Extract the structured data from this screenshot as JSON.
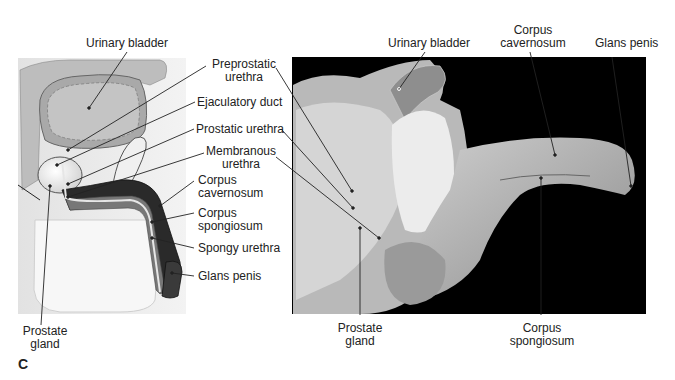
{
  "figure": {
    "panel_letter": "C",
    "illustration": {
      "labels": {
        "urinary_bladder": "Urinary bladder",
        "preprostatic_urethra_1": "Preprostatic",
        "preprostatic_urethra_2": "urethra",
        "ejaculatory_duct": "Ejaculatory duct",
        "prostatic_urethra": "Prostatic urethra",
        "membranous_urethra_1": "Membranous",
        "membranous_urethra_2": "urethra",
        "corpus_cavernosum_1": "Corpus",
        "corpus_cavernosum_2": "cavernosum",
        "corpus_spongiosum_1": "Corpus",
        "corpus_spongiosum_2": "spongiosum",
        "spongy_urethra": "Spongy urethra",
        "glans_penis": "Glans penis",
        "prostate_gland_1": "Prostate",
        "prostate_gland_2": "gland"
      }
    },
    "photo": {
      "labels": {
        "urinary_bladder": "Urinary bladder",
        "corpus_cavernosum_1": "Corpus",
        "corpus_cavernosum_2": "cavernosum",
        "glans_penis": "Glans penis",
        "prostate_gland_1": "Prostate",
        "prostate_gland_2": "gland",
        "corpus_spongiosum_1": "Corpus",
        "corpus_spongiosum_2": "spongiosum"
      }
    }
  }
}
